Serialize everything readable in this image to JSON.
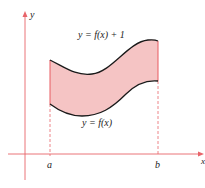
{
  "diagram": {
    "axes": {
      "x_label": "x",
      "y_label": "y",
      "axis_color": "#e8646a"
    },
    "curves": {
      "upper": {
        "label": "y = f(x) + 1",
        "color": "#1a1a1a"
      },
      "lower": {
        "label": "y = f(x)",
        "color": "#1a1a1a"
      }
    },
    "region": {
      "fill": "#f5c2c2",
      "edge_color": "#e85a60"
    },
    "ticks": [
      {
        "label": "a"
      },
      {
        "label": "b"
      }
    ],
    "guide_line_style": "dashed"
  }
}
